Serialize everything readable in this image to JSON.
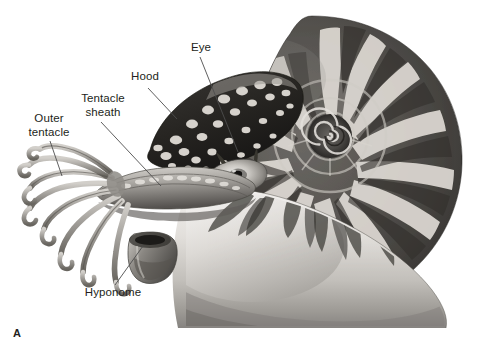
{
  "figure": {
    "panel_letter": "A",
    "background_color": "#ffffff",
    "label_text_color": "#231f20",
    "leader_line_color": "#4d4d4d"
  },
  "labels": [
    {
      "id": "outer-tentacle",
      "text": "Outer\ntentacle",
      "x": 18,
      "y": 112,
      "width": 62,
      "leader": {
        "x1": 50,
        "y1": 141,
        "x2": 62,
        "y2": 176
      }
    },
    {
      "id": "tentacle-sheath",
      "text": "Tentacle\nsheath",
      "x": 70,
      "y": 92,
      "width": 66,
      "leader": {
        "x1": 101,
        "y1": 122,
        "x2": 161,
        "y2": 186
      }
    },
    {
      "id": "hood",
      "text": "Hood",
      "x": 125,
      "y": 70,
      "width": 40,
      "leader": {
        "x1": 148,
        "y1": 88,
        "x2": 177,
        "y2": 119
      }
    },
    {
      "id": "eye",
      "text": "Eye",
      "x": 187,
      "y": 41,
      "width": 28,
      "leader": {
        "x1": 200,
        "y1": 57,
        "x2": 238,
        "y2": 152
      }
    },
    {
      "id": "hyponome",
      "text": "Hyponome",
      "x": 77,
      "y": 286,
      "width": 72,
      "leader": {
        "x1": 115,
        "y1": 285,
        "x2": 143,
        "y2": 246
      }
    }
  ],
  "anatomy_parts": [
    {
      "id": "shell",
      "name": "coiled-striped-shell"
    },
    {
      "id": "shell-spiral",
      "name": "shell-spiral-center"
    },
    {
      "id": "hood",
      "name": "spotted-hood"
    },
    {
      "id": "eye",
      "name": "eye"
    },
    {
      "id": "tentacles",
      "name": "outer-tentacles"
    },
    {
      "id": "tentacle-sheath",
      "name": "tentacle-sheath"
    },
    {
      "id": "hyponome",
      "name": "hyponome-funnel"
    },
    {
      "id": "mantle",
      "name": "body-mantle"
    }
  ],
  "palette": {
    "shell_light": "#e8e6e3",
    "shell_mid": "#9a9793",
    "shell_dark": "#3b3936",
    "shell_stripe": "#5d5a56",
    "hood_dark": "#2e2c2a",
    "hood_spot": "#d8d5d0",
    "flesh_light": "#cfccc7",
    "flesh_mid": "#8e8b86",
    "flesh_dark": "#4a4845"
  }
}
